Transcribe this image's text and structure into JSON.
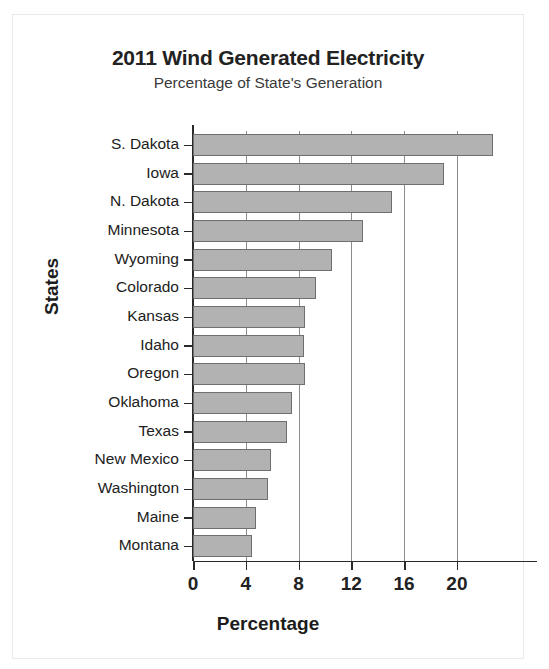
{
  "chart_data": {
    "type": "bar",
    "orientation": "horizontal",
    "title": "2011 Wind Generated Electricity",
    "subtitle": "Percentage of State's Generation",
    "xlabel": "Percentage",
    "ylabel": "States",
    "categories": [
      "S. Dakota",
      "Iowa",
      "N. Dakota",
      "Minnesota",
      "Wyoming",
      "Colorado",
      "Kansas",
      "Idaho",
      "Oregon",
      "Oklahoma",
      "Texas",
      "New Mexico",
      "Washington",
      "Maine",
      "Montana"
    ],
    "values": [
      22.7,
      19.0,
      15.1,
      12.9,
      10.5,
      9.3,
      8.5,
      8.4,
      8.5,
      7.5,
      7.1,
      5.9,
      5.7,
      4.8,
      4.5
    ],
    "xlim": [
      0,
      24.1
    ],
    "xticks": [
      0,
      4,
      8,
      12,
      16,
      20
    ],
    "xtick_labels": [
      "0",
      "4",
      "8",
      "12",
      "16",
      "20"
    ],
    "grid": "vertical",
    "legend": "none",
    "bar_color": "#b2b2b2",
    "bar_edge_color": "#6f6f6f",
    "axis_color": "#2a2a2a",
    "gridline_color": "#8c8c8c",
    "background": "#ffffff"
  }
}
